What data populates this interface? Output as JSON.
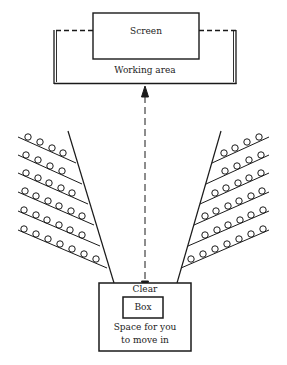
{
  "labels": {
    "screen": "Screen",
    "working_area": "Working area",
    "clear": "Clear",
    "box": "Box",
    "space_line1": "Space for you",
    "space_line2": "to move in"
  },
  "seating": {
    "rows_per_side": 6,
    "left_seats_per_row": [
      4,
      4,
      5,
      6,
      6,
      7
    ],
    "right_seats_per_row": [
      4,
      4,
      5,
      6,
      6,
      7
    ]
  },
  "colors": {
    "stroke": "#1a1a1a",
    "background": "#ffffff"
  }
}
